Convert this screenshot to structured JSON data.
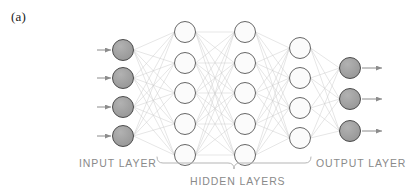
{
  "figure": {
    "panel_label": "(a)",
    "background_color": "#ffffff",
    "width": 414,
    "height": 196
  },
  "captions": {
    "input": "INPUT LAYER",
    "hidden": "HIDDEN LAYERS",
    "output": "OUTPUT LAYER",
    "text_color": "#8a8a8a"
  },
  "style": {
    "input_node_fill": "#9a9a9a",
    "input_node_stroke": "#4d4d4d",
    "hidden_node_fill": "#fbfbfb",
    "hidden_node_stroke": "#565656",
    "output_node_fill": "#9a9a9a",
    "output_node_stroke": "#4d4d4d",
    "connection_color": "#cccccc",
    "arrow_color": "#8c8c8c",
    "brace_color": "#b5b5b5",
    "node_radius": 10.5,
    "connection_width": 0.5
  },
  "chart_data": {
    "type": "diagram",
    "layers": [
      {
        "name": "input",
        "label": "INPUT LAYER",
        "node_count": 4,
        "x": 123,
        "node_y": [
          50,
          78,
          107,
          136
        ],
        "filled": true,
        "has_incoming_arrows": true
      },
      {
        "name": "hidden-1",
        "label": "HIDDEN LAYERS",
        "node_count": 5,
        "x": 185,
        "node_y": [
          32,
          63,
          93,
          124,
          155
        ],
        "filled": false,
        "has_incoming_arrows": false
      },
      {
        "name": "hidden-2",
        "label": "HIDDEN LAYERS",
        "node_count": 5,
        "x": 245,
        "node_y": [
          32,
          63,
          93,
          124,
          155
        ],
        "filled": false,
        "has_incoming_arrows": false
      },
      {
        "name": "hidden-3",
        "label": "HIDDEN LAYERS",
        "node_count": 4,
        "x": 300,
        "node_y": [
          48,
          78,
          108,
          138
        ],
        "filled": false,
        "has_incoming_arrows": false
      },
      {
        "name": "output",
        "label": "OUTPUT LAYER",
        "node_count": 3,
        "x": 350,
        "node_y": [
          68,
          99,
          131
        ],
        "filled": true,
        "has_outgoing_arrows": true
      }
    ],
    "fully_connected": true,
    "input_arrow_x_start": 97,
    "input_arrow_x_end": 111,
    "output_arrow_x_start": 362,
    "output_arrow_x_end": 382,
    "hidden_brace": {
      "x_start": 157,
      "x_end": 311,
      "y": 163
    }
  }
}
